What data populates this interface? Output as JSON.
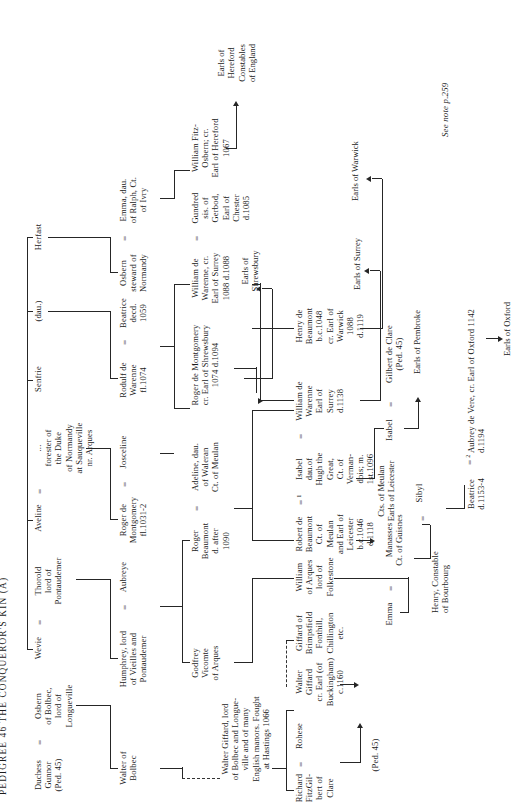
{
  "page": {
    "title": "PEDIGREE 46      THE CONQUEROR'S KIN (A)",
    "footnote": "See note p.259"
  },
  "generations": {
    "g1": [
      {
        "name": "Duchess\nGunnor\n(Ped. 45)"
      },
      {
        "name": "Osbern\nof Bolbec,\nlord of\nLongueville"
      },
      {
        "name": "Wevie"
      },
      {
        "name": "Thorold\nlord of\nPontaudemer"
      },
      {
        "name": "Aveline"
      },
      {
        "name": "...\nforester of\nthe Duke\nof Normandy\nat Sauqueville\nnr. Arques"
      },
      {
        "name": "Senfrie"
      },
      {
        "name": "(dau.)"
      },
      {
        "name": "Herfast"
      }
    ],
    "g2": [
      {
        "name": "Walter of\nBolbec"
      },
      {
        "name": "Humphrey, lord\nof Vieilles and\nPontaudemer"
      },
      {
        "name": "Aubreye"
      },
      {
        "name": "Roger de\nMontgomery\nfl.1031-2"
      },
      {
        "name": "Josceline"
      },
      {
        "name": "Rodulf de\nWarenne\nfl.1074"
      },
      {
        "name": "Beatrice\ndecd.\n1059"
      },
      {
        "name": "Osbern\nsteward of\nNormandy"
      },
      {
        "name": "Emma, dau.\nof Ralph, Ct.\nof Ivry"
      }
    ],
    "g3": [
      {
        "name": "Walter Giffard, lord\nof Bolbec and Longue-\nville and of many\nEnglish manors. Fought\nat Hastings 1066"
      },
      {
        "name": "Godfrey\nVicomte\nof Arques"
      },
      {
        "name": "Roger\nBeaumont\nd. after\n1090"
      },
      {
        "name": "Adeline, dau.\nof Waleran\nCt. of Meulan"
      },
      {
        "name": "Roger de Montgomery\ncr. Earl of Shrewsbury\n1074 d.1094"
      },
      {
        "name": "William de\nWarenne, cr.\nEarl of Surrey\n1088 d.1088"
      },
      {
        "name": "Gundred\nsis. of\nGerbod,\nEarl of\nChester\nd.1085"
      },
      {
        "name": "William Fitz-\nOsbern; cr.\nEarl of Hereford\n1067"
      }
    ],
    "g4": [
      {
        "name": "Richard\nFitzGil-\nbert of\nClare"
      },
      {
        "name": "Rohese"
      },
      {
        "name": "Walter\nGiffard\ncr. Earl (of\nBuckingham)\nc.1160"
      },
      {
        "name": "Giffard of\nBrimpsfield\nFonthill,\nChillington\netc."
      },
      {
        "name": "William\nof Arques\nlord of\nFolkestone"
      },
      {
        "name": "Robert de\nBeaumont\nCt. of\nMeulan\nand Earl of\nLeicester\nb.c.1046\nd.1118"
      },
      {
        "name": "Isabel\ndau.of\nHugh the\nGreat,\nCt. of\nVerman-\ndois; m.\n1st.1096",
        "sup": "1"
      },
      {
        "name": "William de\nWarenne\nEarl of\nSurrey\nd.1138"
      },
      {
        "name": "Henry de\nBeaumont\nb.c.1048\ncr. Earl of\nWarwick\n1088\nd.1119"
      }
    ],
    "g5": [
      {
        "name": "(Ped. 45)"
      },
      {
        "name": "Emma"
      },
      {
        "name": "Manasses\nCt. of Guisnes"
      },
      {
        "name": "Isabel"
      },
      {
        "name": "Gilbert de Clare\n(Ped. 45)"
      }
    ],
    "g6": [
      {
        "name": "Henry, Constable\nof Bourbourg"
      },
      {
        "name": "Sibyl"
      },
      {
        "name": "Beatrice\nd.1153-4"
      },
      {
        "name": "Aubrey de Vere, cr. Earl of Oxford 1142\nd.1194",
        "sup": "2"
      }
    ]
  },
  "outcomes": [
    {
      "label": "Earls of\nHereford\nConstables\nof England"
    },
    {
      "label": "Earls of\nShrewsbury"
    },
    {
      "label": "Earls of Warwick"
    },
    {
      "label": "Earls of Surrey"
    },
    {
      "label": "Earls of Pembroke"
    },
    {
      "label": "Cts. of Meulan\nEarls of Leicester"
    },
    {
      "label": "Earls of Oxford"
    }
  ]
}
